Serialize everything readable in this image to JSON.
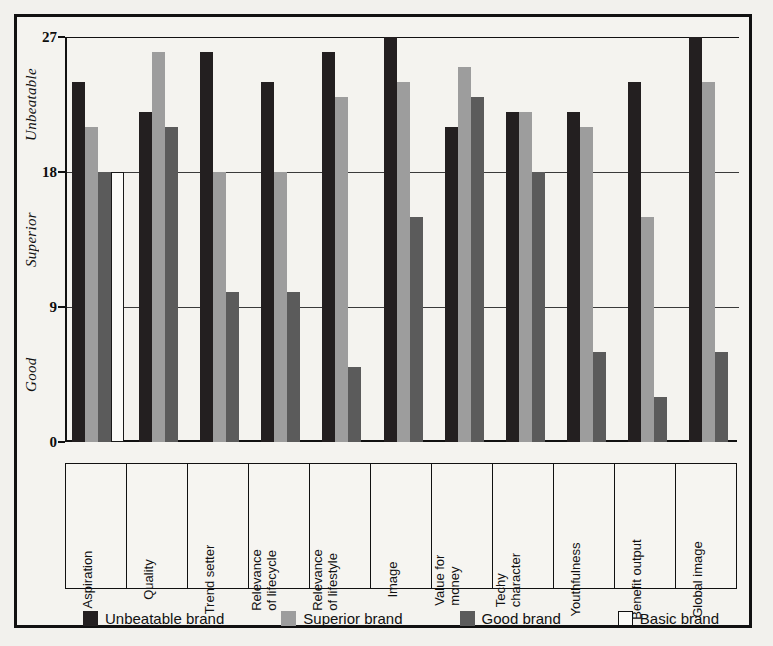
{
  "chart_data": {
    "type": "bar",
    "title": "",
    "xlabel": "",
    "ylabel": "",
    "ylim": [
      0,
      27
    ],
    "grid": true,
    "legend_position": "bottom",
    "yticks": [
      "0",
      "9",
      "18",
      "27"
    ],
    "ytick_values": [
      0,
      9,
      18,
      27
    ],
    "y_band_labels": [
      "Good",
      "Superior",
      "Unbeatable"
    ],
    "categories": [
      "Aspiration",
      "Quality",
      "Trend setter",
      "Relevance of lifecycle",
      "Relevance of lifestyle",
      "Image",
      "Value for money",
      "Techy character",
      "Youthfulness",
      "Benefit output",
      "Global image"
    ],
    "category_lines": [
      [
        "Aspiration"
      ],
      [
        "Quality"
      ],
      [
        "Trend setter"
      ],
      [
        "Relevance",
        "of lifecycle"
      ],
      [
        "Relevance",
        "of lifestyle"
      ],
      [
        "Image"
      ],
      [
        "Value for",
        "money"
      ],
      [
        "Techy",
        "character"
      ],
      [
        "Youthfulness"
      ],
      [
        "Benefit output"
      ],
      [
        "Global image"
      ]
    ],
    "series": [
      {
        "name": "Unbeatable brand",
        "color": "#231f20",
        "values": [
          24,
          22,
          26,
          24,
          26,
          27,
          21,
          22,
          22,
          24,
          27
        ]
      },
      {
        "name": "Superior brand",
        "color": "#9d9d9d",
        "values": [
          21,
          26,
          18,
          18,
          23,
          24,
          25,
          22,
          21,
          15,
          24
        ]
      },
      {
        "name": "Good brand",
        "color": "#5b5b5b",
        "values": [
          18,
          21,
          10,
          10,
          5,
          15,
          23,
          18,
          6,
          3,
          6
        ]
      },
      {
        "name": "Basic brand",
        "color": "#ffffff",
        "values": [
          18,
          0,
          0,
          0,
          0,
          0,
          0,
          0,
          0,
          0,
          0
        ]
      }
    ]
  },
  "legend": {
    "items": [
      {
        "label": "Unbeatable brand",
        "swatch": "dark-swatch"
      },
      {
        "label": "Superior brand",
        "swatch": "light-gray-swatch"
      },
      {
        "label": "Good brand",
        "swatch": "mid-gray-swatch"
      },
      {
        "label": "Basic brand",
        "swatch": "white-swatch"
      }
    ]
  },
  "colors": {
    "unbeatable": "#231f20",
    "superior": "#9d9d9d",
    "good": "#5b5b5b",
    "basic": "#ffffff",
    "axis": "#111111",
    "page_background": "#f2f1ed",
    "plot_background": "#f4f3ef"
  }
}
